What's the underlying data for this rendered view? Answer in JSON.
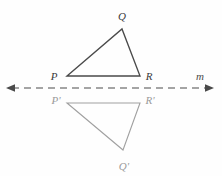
{
  "figure": {
    "kind": "reflection-diagram",
    "background_color": "#fefefe",
    "width": 222,
    "height": 176
  },
  "line_of_reflection": {
    "name": "m",
    "label": "m",
    "label_x": 197,
    "label_y": 79,
    "color": "#4a4a4a",
    "y": 88,
    "x_start": 12,
    "x_end": 208,
    "dash_pattern": "7 5",
    "arrow_left": true,
    "arrow_right": true
  },
  "preimage": {
    "name": "triangle PQR",
    "color": "#4a4a4a",
    "stroke_width": 1.3,
    "vertices": [
      {
        "label": "P",
        "x": 67,
        "y": 76,
        "label_x": 54,
        "label_y": 78
      },
      {
        "label": "Q",
        "x": 122,
        "y": 29,
        "label_x": 119,
        "label_y": 18
      },
      {
        "label": "R",
        "x": 140,
        "y": 76,
        "label_x": 145,
        "label_y": 78
      }
    ],
    "path": "M 67 76 L 122 29 L 140 76 Z"
  },
  "image": {
    "name": "triangle P prime Q prime R prime",
    "color": "#a0a0a0",
    "stroke_width": 1.1,
    "vertices": [
      {
        "label": "P'",
        "x": 67,
        "y": 103,
        "label_x": 53,
        "label_y": 102
      },
      {
        "label": "Q'",
        "x": 123,
        "y": 150,
        "label_x": 120,
        "label_y": 167
      },
      {
        "label": "R'",
        "x": 140,
        "y": 103,
        "label_x": 145,
        "label_y": 102
      }
    ],
    "path": "M 67 103 L 123 150 L 140 103 Z"
  }
}
